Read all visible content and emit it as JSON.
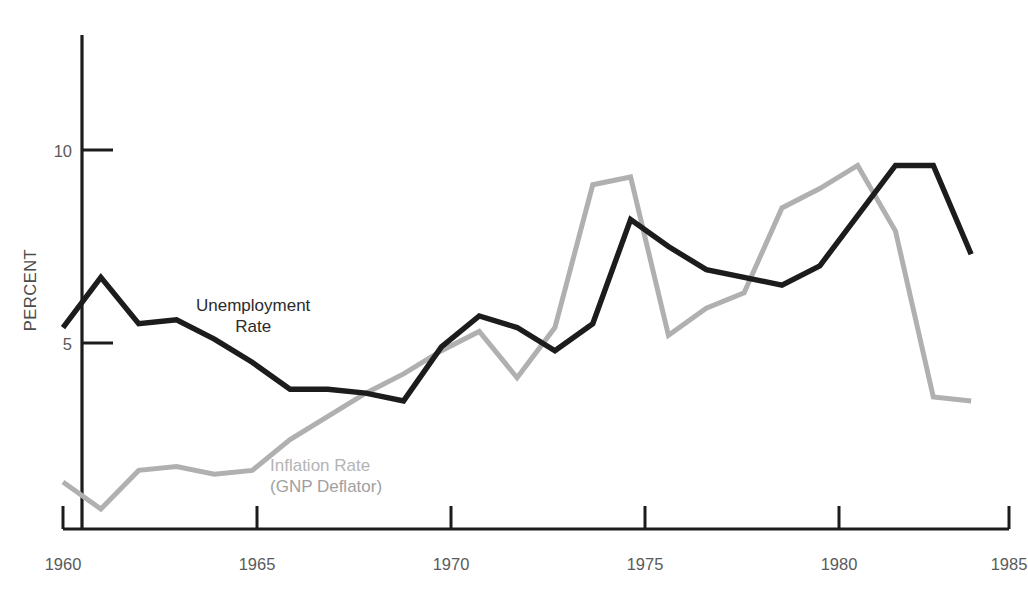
{
  "chart_data": {
    "type": "line",
    "title": "",
    "subtitle": "",
    "xlabel": "",
    "ylabel": "PERCENT",
    "xlim": [
      1960,
      1985
    ],
    "ylim": [
      0,
      11.5
    ],
    "grid": false,
    "legend_position": "inline-annotations",
    "x_ticks": [
      "1960",
      "1965",
      "1970",
      "1975",
      "1980",
      "1985"
    ],
    "x_tick_values": [
      1960,
      1965,
      1970,
      1975,
      1980,
      1985
    ],
    "y_ticks": [
      "5",
      "10"
    ],
    "y_tick_values": [
      5,
      10
    ],
    "x": [
      1960,
      1961,
      1962,
      1963,
      1964,
      1965,
      1966,
      1967,
      1968,
      1969,
      1970,
      1971,
      1972,
      1973,
      1974,
      1975,
      1976,
      1977,
      1978,
      1979,
      1980,
      1981,
      1982,
      1983,
      1984
    ],
    "series": [
      {
        "name": "Unemployment Rate",
        "color": "#1c1c1c",
        "label_lines": [
          "Unemployment",
          "Rate"
        ],
        "values": [
          5.4,
          6.7,
          5.5,
          5.6,
          5.1,
          4.5,
          3.8,
          3.8,
          3.7,
          3.5,
          4.9,
          5.7,
          5.4,
          4.8,
          5.5,
          8.2,
          7.5,
          6.9,
          6.7,
          6.5,
          7.0,
          8.3,
          9.6,
          9.6,
          7.3
        ]
      },
      {
        "name": "Inflation Rate (GNP Deflator)",
        "color": "#b0b0b0",
        "label_lines": [
          "Inflation Rate",
          "(GNP Deflator)"
        ],
        "values": [
          1.4,
          0.7,
          1.7,
          1.8,
          1.6,
          1.7,
          2.5,
          3.1,
          3.7,
          4.2,
          4.8,
          5.3,
          4.1,
          5.4,
          9.1,
          9.3,
          5.2,
          5.9,
          6.3,
          8.5,
          9.0,
          9.6,
          7.9,
          3.6,
          3.5
        ]
      }
    ]
  },
  "axes": {
    "y_axis_label": "PERCENT",
    "y_tick_labels": [
      "10",
      "5"
    ],
    "x_tick_labels": [
      "1960",
      "1965",
      "1970",
      "1975",
      "1980",
      "1985"
    ]
  },
  "annotations": {
    "unemployment": {
      "line1": "Unemployment",
      "line2": "Rate"
    },
    "inflation": {
      "line1": "Inflation Rate",
      "line2": "(GNP Deflator)"
    }
  },
  "colors": {
    "unemployment_line": "#1c1c1c",
    "inflation_line": "#b0b0b0",
    "axis": "#1c1c1c",
    "tick_text": "#5a5a5a",
    "background": "#ffffff"
  }
}
